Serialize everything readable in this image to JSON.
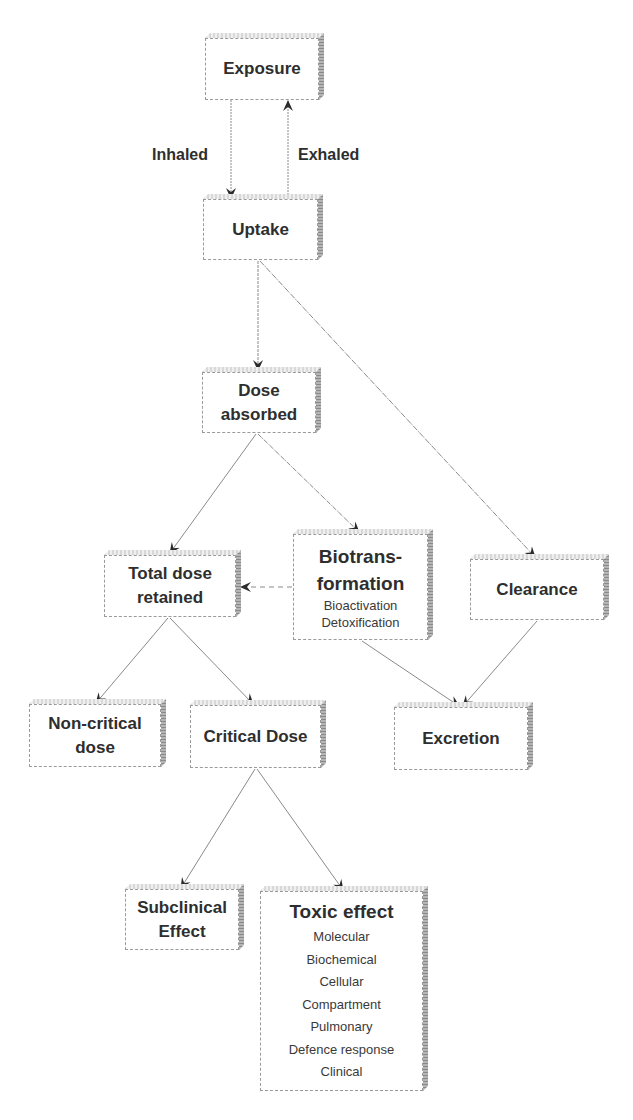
{
  "diagram": {
    "nodes": {
      "exposure": {
        "title": "Exposure"
      },
      "uptake": {
        "title": "Uptake"
      },
      "dose_absorbed": {
        "title_line1": "Dose",
        "title_line2": "absorbed"
      },
      "total_dose_retained": {
        "title_line1": "Total dose",
        "title_line2": "retained"
      },
      "biotransformation": {
        "title_line1": "Biotrans-",
        "title_line2": "formation",
        "items": [
          "Bioactivation",
          "Detoxification"
        ]
      },
      "clearance": {
        "title": "Clearance"
      },
      "non_critical_dose": {
        "title_line1": "Non-critical",
        "title_line2": "dose"
      },
      "critical_dose": {
        "title": "Critical Dose"
      },
      "excretion": {
        "title": "Excretion"
      },
      "subclinical_effect": {
        "title_line1": "Subclinical",
        "title_line2": "Effect"
      },
      "toxic_effect": {
        "title": "Toxic effect",
        "items": [
          "Molecular",
          "Biochemical",
          "Cellular",
          "Compartment",
          "Pulmonary",
          "Defence response",
          "Clinical"
        ]
      }
    },
    "edge_labels": {
      "inhaled": "Inhaled",
      "exhaled": "Exhaled"
    },
    "edges": [
      {
        "from": "Exposure",
        "to": "Uptake",
        "label": "Inhaled"
      },
      {
        "from": "Uptake",
        "to": "Exposure",
        "label": "Exhaled"
      },
      {
        "from": "Uptake",
        "to": "Dose absorbed"
      },
      {
        "from": "Uptake",
        "to": "Clearance"
      },
      {
        "from": "Dose absorbed",
        "to": "Total dose retained"
      },
      {
        "from": "Dose absorbed",
        "to": "Biotransformation"
      },
      {
        "from": "Biotransformation",
        "to": "Total dose retained",
        "style": "dashed"
      },
      {
        "from": "Biotransformation",
        "to": "Excretion"
      },
      {
        "from": "Clearance",
        "to": "Excretion"
      },
      {
        "from": "Total dose retained",
        "to": "Non-critical dose"
      },
      {
        "from": "Total dose retained",
        "to": "Critical Dose"
      },
      {
        "from": "Critical Dose",
        "to": "Subclinical Effect"
      },
      {
        "from": "Critical Dose",
        "to": "Toxic effect"
      }
    ],
    "colors": {
      "line": "#7a7a7a",
      "arrowhead": "#2b2b2b",
      "text": "#2e2e2e",
      "box_side": "#9a9a9a"
    }
  }
}
